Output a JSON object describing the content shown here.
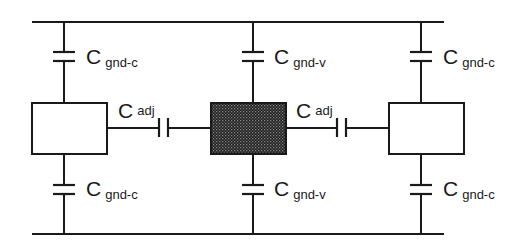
{
  "diagram": {
    "colors": {
      "line": "#1a1a1a",
      "victim_fill": "#2b2b2b",
      "background": "#ffffff"
    },
    "nodes": [
      {
        "id": "left-conductor",
        "style": "open"
      },
      {
        "id": "victim-conductor",
        "style": "hatched-dark"
      },
      {
        "id": "right-conductor",
        "style": "open"
      }
    ],
    "labels": {
      "top_left": {
        "main": "C",
        "sub": "gnd-c"
      },
      "top_center": {
        "main": "C",
        "sub": "gnd-v"
      },
      "top_right": {
        "main": "C",
        "sub": "gnd-c"
      },
      "adj_left": {
        "main": "C",
        "sub": "adj"
      },
      "adj_right": {
        "main": "C",
        "sub": "adj"
      },
      "bot_left": {
        "main": "C",
        "sub": "gnd-c"
      },
      "bot_center": {
        "main": "C",
        "sub": "gnd-v"
      },
      "bot_right": {
        "main": "C",
        "sub": "gnd-c"
      }
    },
    "rails": [
      "top-ground-rail",
      "bottom-ground-rail"
    ]
  }
}
